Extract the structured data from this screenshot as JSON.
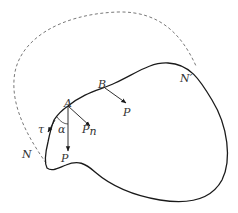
{
  "diagram": {
    "type": "mechanics-free-body",
    "colors": {
      "stroke": "#1a1a1a",
      "dashed": "#555555",
      "label": "#333333"
    },
    "labels": {
      "point_a": "A",
      "point_b": "B",
      "point_n": "N",
      "point_n_prime": "N′",
      "force_a": "P",
      "force_b": "P",
      "normal_component": "P",
      "normal_subscript": "n",
      "tangent": "τ",
      "angle": "α"
    }
  }
}
